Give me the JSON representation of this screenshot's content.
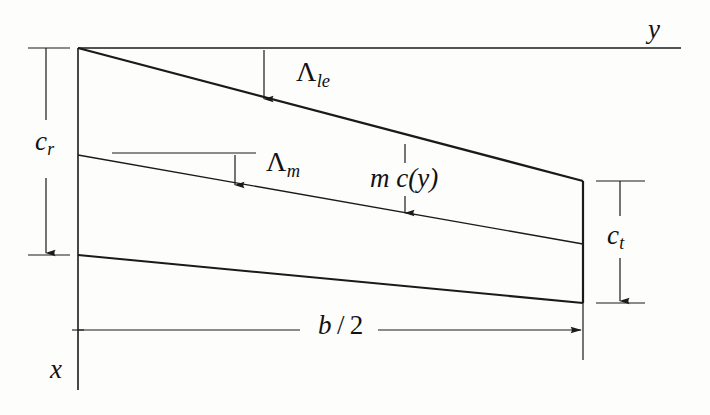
{
  "figure": {
    "kind": "wing-planform-geometry-diagram",
    "background_color": "#fdfdfc",
    "line_color": "#1a1a1a"
  },
  "axes": {
    "spanwise": {
      "name": "y",
      "label": "y",
      "orientation": "horizontal",
      "line_y": 48,
      "line_x_start": 78,
      "line_x_end": 681
    },
    "chordwise": {
      "name": "x",
      "label": "x",
      "orientation": "vertical",
      "line_x": 78,
      "line_y_start": 48,
      "line_y_end": 390
    }
  },
  "dimensions": {
    "root_chord": {
      "symbol": "c",
      "subscript": "r",
      "label": "c_r",
      "position": "left"
    },
    "tip_chord": {
      "symbol": "c",
      "subscript": "t",
      "label": "c_t",
      "position": "right"
    },
    "semi_span": {
      "label": "b / 2",
      "numerator": "b",
      "divider": "/",
      "denominator": "2",
      "position": "bottom"
    }
  },
  "angles": {
    "leading_edge_sweep": {
      "symbol": "Λ",
      "subscript": "le",
      "label": "Λ_le"
    },
    "mid_chord_sweep": {
      "symbol": "Λ",
      "subscript": "m",
      "label": "Λ_m"
    }
  },
  "annotations": {
    "chord_fraction": {
      "label": "m c(y)",
      "meaning": "fraction m of local chord c(y)"
    }
  },
  "geometry": {
    "root_leading_edge": [
      78,
      48
    ],
    "root_mid_chord": [
      78,
      155
    ],
    "root_trailing_edge": [
      78,
      255
    ],
    "tip_leading_edge": [
      583,
      181
    ],
    "tip_mid_chord": [
      583,
      244
    ],
    "tip_trailing_edge": [
      583,
      303
    ]
  },
  "labels": {
    "y": "y",
    "x": "x",
    "c": "c",
    "r": "r",
    "t": "t",
    "lambda": "Λ",
    "le": "le",
    "m": "m",
    "mcy": "m c(y)",
    "b": "b",
    "slash": "/",
    "two": "2"
  }
}
